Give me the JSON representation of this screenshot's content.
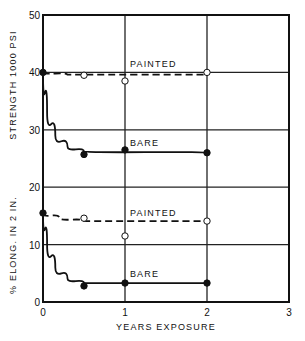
{
  "chart_data": {
    "type": "line",
    "title": "",
    "xlabel": "YEARS EXPOSURE",
    "ylabel_upper": "STRENGTH 1000 PSI",
    "ylabel_lower": "% ELONG. IN 2 IN.",
    "xlim": [
      0,
      3
    ],
    "ylim": [
      0,
      50
    ],
    "x_ticks": [
      0,
      1,
      2,
      3
    ],
    "y_ticks": [
      0,
      10,
      20,
      30,
      40,
      50
    ],
    "grid": true,
    "series": [
      {
        "name": "Strength - PAINTED",
        "label": "PAINTED",
        "style": "dashed",
        "marker": "open-circle",
        "points": [
          [
            0,
            40
          ],
          [
            0.5,
            39.5
          ],
          [
            1,
            38.5
          ],
          [
            2,
            40
          ]
        ],
        "curve": [
          [
            0,
            40
          ],
          [
            0.3,
            39.6
          ],
          [
            2,
            39.6
          ]
        ]
      },
      {
        "name": "Strength - BARE",
        "label": "BARE",
        "style": "solid",
        "marker": "filled-circle",
        "points": [
          [
            0,
            40
          ],
          [
            0.5,
            25.7
          ],
          [
            1,
            26.5
          ],
          [
            2,
            26
          ]
        ],
        "curve": [
          [
            0,
            40
          ],
          [
            0.05,
            33
          ],
          [
            0.15,
            29
          ],
          [
            0.3,
            27
          ],
          [
            0.5,
            26.2
          ],
          [
            2,
            26
          ]
        ]
      },
      {
        "name": "Elongation - PAINTED",
        "label": "PAINTED",
        "style": "dashed",
        "marker": "open-circle",
        "points": [
          [
            0,
            15.5
          ],
          [
            0.5,
            14.6
          ],
          [
            1,
            11.5
          ],
          [
            2,
            14.1
          ]
        ],
        "curve": [
          [
            0,
            15.5
          ],
          [
            0.2,
            14.6
          ],
          [
            0.5,
            14.1
          ],
          [
            2,
            14.1
          ]
        ]
      },
      {
        "name": "Elongation - BARE",
        "label": "BARE",
        "style": "solid",
        "marker": "filled-circle",
        "points": [
          [
            0,
            15.5
          ],
          [
            0.5,
            2.8
          ],
          [
            1,
            3.3
          ],
          [
            2,
            3.3
          ]
        ],
        "curve": [
          [
            0,
            15.5
          ],
          [
            0.05,
            10
          ],
          [
            0.15,
            6
          ],
          [
            0.3,
            4
          ],
          [
            0.5,
            3.3
          ],
          [
            2,
            3.3
          ]
        ]
      }
    ]
  }
}
